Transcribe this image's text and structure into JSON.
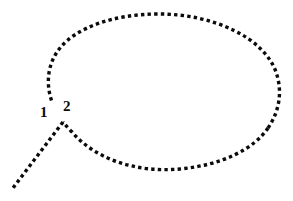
{
  "figure": {
    "width": 293,
    "height": 201,
    "background_color": "#ffffff",
    "stroke_color": "#0b0b0b",
    "labels": [
      {
        "id": "1",
        "text": "1",
        "x": 44,
        "y": 113
      },
      {
        "id": "2",
        "text": "2",
        "x": 69,
        "y": 107
      }
    ],
    "shapes": {
      "balloon": {
        "kind": "ellipse",
        "style": "dotted",
        "center_x": 165,
        "center_y": 92,
        "radius_x": 113,
        "radius_y": 78,
        "dot_size": 3.4,
        "dot_gap": 3.2
      },
      "tail": {
        "kind": "polyline",
        "style": "dotted",
        "points": "63,122 13,188",
        "dot_size": 3.4,
        "dot_gap": 3.2
      },
      "gap_arc": {
        "note": "balloon outline is interrupted between the tail junction and the left arc terminus",
        "start_angle_deg": 150,
        "end_angle_deg": 202
      }
    }
  }
}
